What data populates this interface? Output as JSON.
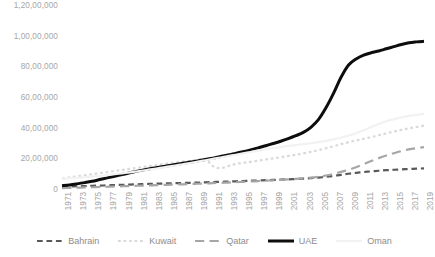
{
  "chart_data": {
    "type": "line",
    "title": "",
    "xlabel": "",
    "ylabel": "",
    "ylim": [
      0,
      12000000
    ],
    "ytick_labels": [
      "1,20,00,000",
      "1,00,00,000",
      "80,00,000",
      "60,00,000",
      "40,00,000",
      "20,00,000",
      "0"
    ],
    "ytick_values": [
      12000000,
      10000000,
      8000000,
      6000000,
      4000000,
      2000000,
      0
    ],
    "grid": false,
    "legend_position": "bottom",
    "number_format": "indian",
    "x": [
      1971,
      1972,
      1973,
      1974,
      1975,
      1976,
      1977,
      1978,
      1979,
      1980,
      1981,
      1982,
      1983,
      1984,
      1985,
      1986,
      1987,
      1988,
      1989,
      1990,
      1991,
      1992,
      1993,
      1994,
      1995,
      1996,
      1997,
      1998,
      1999,
      2000,
      2001,
      2002,
      2003,
      2004,
      2005,
      2006,
      2007,
      2008,
      2009,
      2010,
      2011,
      2012,
      2013,
      2014,
      2015,
      2016,
      2017,
      2018,
      2019
    ],
    "xtick_labels": [
      "1971",
      "1973",
      "1975",
      "1977",
      "1979",
      "1981",
      "1983",
      "1985",
      "1987",
      "1989",
      "1991",
      "1993",
      "1995",
      "1997",
      "1999",
      "2001",
      "2003",
      "2005",
      "2007",
      "2009",
      "2011",
      "2013",
      "2015",
      "2017",
      "2019"
    ],
    "series": [
      {
        "name": "Bahrain",
        "color": "#595959",
        "style": "dashed",
        "width": 2.2,
        "marker": "dot",
        "values": [
          220000,
          232000,
          245000,
          258000,
          272000,
          287000,
          303000,
          320000,
          337000,
          355000,
          372000,
          388000,
          403000,
          417000,
          430000,
          443000,
          456000,
          470000,
          484000,
          499000,
          515000,
          532000,
          550000,
          568000,
          586000,
          604000,
          622000,
          640000,
          658000,
          677000,
          697000,
          718000,
          742000,
          772000,
          810000,
          860000,
          920000,
          990000,
          1060000,
          1120000,
          1170000,
          1215000,
          1255000,
          1290000,
          1320000,
          1345000,
          1370000,
          1390000,
          1410000
        ]
      },
      {
        "name": "Kuwait",
        "color": "#d9d9d9",
        "style": "dotted",
        "width": 2.2,
        "marker": "none",
        "values": [
          750000,
          820000,
          890000,
          960000,
          1030000,
          1100000,
          1170000,
          1240000,
          1310000,
          1380000,
          1450000,
          1520000,
          1590000,
          1660000,
          1730000,
          1790000,
          1850000,
          1910000,
          1970000,
          2030000,
          1560000,
          1420000,
          1550000,
          1690000,
          1770000,
          1840000,
          1910000,
          1990000,
          2060000,
          2140000,
          2220000,
          2300000,
          2390000,
          2490000,
          2600000,
          2720000,
          2850000,
          2990000,
          3120000,
          3230000,
          3340000,
          3450000,
          3570000,
          3690000,
          3810000,
          3920000,
          4020000,
          4110000,
          4200000
        ]
      },
      {
        "name": "Qatar",
        "color": "#a6a6a6",
        "style": "long-dash",
        "width": 2.2,
        "marker": "none",
        "values": [
          120000,
          135000,
          150000,
          165000,
          180000,
          196000,
          212000,
          228000,
          244000,
          260000,
          276000,
          292000,
          308000,
          324000,
          340000,
          356000,
          372000,
          390000,
          408000,
          427000,
          446000,
          466000,
          487000,
          509000,
          532000,
          556000,
          581000,
          607000,
          634000,
          662000,
          692000,
          724000,
          760000,
          805000,
          865000,
          945000,
          1050000,
          1180000,
          1320000,
          1480000,
          1680000,
          1890000,
          2080000,
          2250000,
          2400000,
          2540000,
          2650000,
          2730000,
          2800000
        ]
      },
      {
        "name": "UAE",
        "color": "#0d0d0d",
        "style": "solid",
        "width": 3.0,
        "marker": "none",
        "values": [
          280000,
          330000,
          400000,
          480000,
          570000,
          680000,
          790000,
          900000,
          1010000,
          1120000,
          1230000,
          1330000,
          1420000,
          1500000,
          1580000,
          1660000,
          1740000,
          1820000,
          1900000,
          1990000,
          2080000,
          2180000,
          2280000,
          2390000,
          2500000,
          2620000,
          2750000,
          2890000,
          3030000,
          3180000,
          3350000,
          3540000,
          3760000,
          4090000,
          4590000,
          5360000,
          6300000,
          7350000,
          8150000,
          8550000,
          8800000,
          8950000,
          9070000,
          9210000,
          9350000,
          9490000,
          9600000,
          9660000,
          9700000
        ]
      },
      {
        "name": "Oman",
        "color": "#f2f2f2",
        "style": "solid",
        "width": 2.2,
        "marker": "none",
        "values": [
          730000,
          760000,
          790000,
          830000,
          870000,
          920000,
          970000,
          1030000,
          1090000,
          1150000,
          1220000,
          1290000,
          1360000,
          1440000,
          1520000,
          1600000,
          1680000,
          1760000,
          1850000,
          1940000,
          2030000,
          2120000,
          2210000,
          2300000,
          2390000,
          2480000,
          2570000,
          2650000,
          2730000,
          2800000,
          2870000,
          2930000,
          2990000,
          3050000,
          3120000,
          3200000,
          3300000,
          3420000,
          3550000,
          3700000,
          3900000,
          4100000,
          4300000,
          4480000,
          4620000,
          4740000,
          4830000,
          4900000,
          4970000
        ]
      }
    ]
  }
}
